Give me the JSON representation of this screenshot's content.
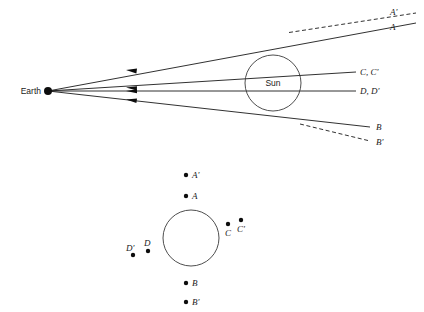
{
  "figure": {
    "title": "",
    "upper_diagram": {
      "earth_label": "Earth",
      "sun_label": "Sun",
      "ray_labels": {
        "a_prime": "A'",
        "a": "A",
        "c_pair": "C, C'",
        "d_pair": "D, D'",
        "b": "B",
        "b_prime": "B'"
      }
    },
    "lower_diagram": {
      "point_labels": {
        "a_prime": "A'",
        "a": "A",
        "c": "C",
        "c_prime": "C'",
        "d": "D",
        "d_prime": "D'",
        "b": "B",
        "b_prime": "B'"
      }
    },
    "colors": {
      "line": "#1a1a1a",
      "circle": "#3a3a3a",
      "dot": "#0d0d0d",
      "background": "#ffffff"
    }
  }
}
